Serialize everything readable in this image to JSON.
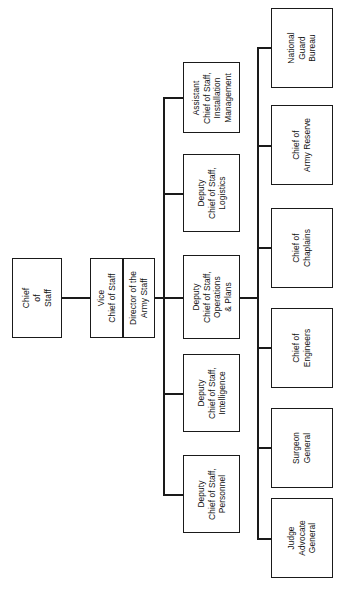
{
  "chart": {
    "type": "organization-chart",
    "orientation": "sideways-rotated-90ccw",
    "background_color": "#ffffff",
    "line_color": "#1a1a1a",
    "text_color": "#111111",
    "levels": 3
  },
  "root": {
    "id": "chief-of-staff",
    "label": "Chief\nof\nStaff",
    "line1": "Chief",
    "line2": "of",
    "line3": "Staff"
  },
  "second_level": {
    "id": "vice-chief-group",
    "panes": [
      {
        "id": "vice-chief-of-staff",
        "line1": "Vice",
        "line2": "Chief of Staff"
      },
      {
        "id": "director-army-staff",
        "line1": "Director of the",
        "line2": "Army Staff"
      }
    ]
  },
  "staff_column": {
    "name": "Deputy and Assistant Chiefs of Staff",
    "items": [
      {
        "id": "acs-installation-management",
        "line1": "Assistant",
        "line2": "Chief of Staff,",
        "line3": "Installation",
        "line4": "Management"
      },
      {
        "id": "dcs-logistics",
        "line1": "Deputy",
        "line2": "Chief of Staff,",
        "line3": "Logistics"
      },
      {
        "id": "dcs-operations-plans",
        "line1": "Deputy",
        "line2": "Chief of Staff,",
        "line3": "Operations",
        "line4": "& Plans"
      },
      {
        "id": "dcs-intelligence",
        "line1": "Deputy",
        "line2": "Chief of Staff,",
        "line3": "Intelligence"
      },
      {
        "id": "dcs-personnel",
        "line1": "Deputy",
        "line2": "Chief of Staff,",
        "line3": "Personnel"
      }
    ]
  },
  "special_staff_column": {
    "name": "Special Staff and Chiefs",
    "items": [
      {
        "id": "national-guard-bureau",
        "line1": "National",
        "line2": "Guard",
        "line3": "Bureau"
      },
      {
        "id": "chief-army-reserve",
        "line1": "Chief of",
        "line2": "Army Reserve"
      },
      {
        "id": "chief-of-chaplains",
        "line1": "Chief of",
        "line2": "Chaplains"
      },
      {
        "id": "chief-of-engineers",
        "line1": "Chief of",
        "line2": "Engineers"
      },
      {
        "id": "surgeon-general",
        "line1": "Surgeon",
        "line2": "General"
      },
      {
        "id": "judge-advocate-general",
        "line1": "Judge",
        "line2": "Advocate",
        "line3": "General"
      }
    ]
  }
}
